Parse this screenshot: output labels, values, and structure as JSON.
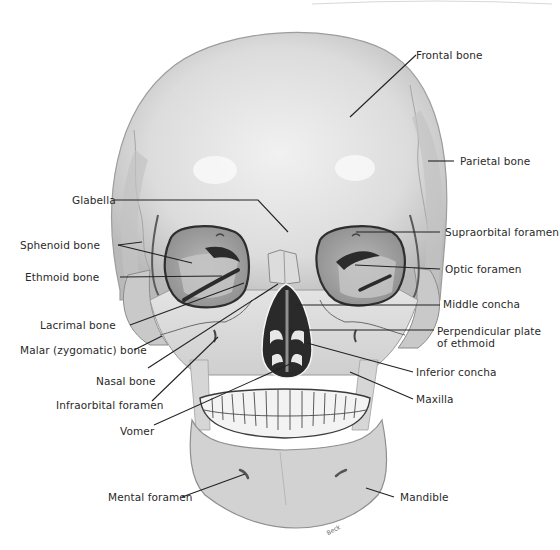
{
  "diagram": {
    "signature": "Beck",
    "colors": {
      "background": "#ffffff",
      "bone_light": "#e6e6e6",
      "bone_mid": "#cfcfcf",
      "bone_dark": "#a8a8a8",
      "orbit_fill": "#9a9a9a",
      "cavity_dark": "#2c2c2c",
      "leader_line": "#222222",
      "label_text": "#2a2a2a"
    },
    "labels_left": [
      {
        "id": "glabella",
        "text": "Glabella",
        "x": 72,
        "y": 194,
        "line": [
          [
            114,
            200
          ],
          [
            258,
            200
          ],
          [
            288,
            232
          ]
        ]
      },
      {
        "id": "sphenoid-bone",
        "text": "Sphenoid bone",
        "x": 20,
        "y": 239,
        "line": [
          [
            118,
            245
          ],
          [
            142,
            242
          ]
        ],
        "line2": [
          [
            118,
            245
          ],
          [
            192,
            263
          ]
        ]
      },
      {
        "id": "ethmoid-bone",
        "text": "Ethmoid bone",
        "x": 25,
        "y": 271,
        "line": [
          [
            120,
            277
          ],
          [
            222,
            276
          ]
        ]
      },
      {
        "id": "lacrimal-bone",
        "text": "Lacrimal bone",
        "x": 40,
        "y": 319,
        "line": [
          [
            130,
            325
          ],
          [
            244,
            283
          ]
        ]
      },
      {
        "id": "malar-zygomatic-bone",
        "text": "Malar (zygomatic) bone",
        "x": 20,
        "y": 344,
        "line": [
          [
            134,
            350
          ],
          [
            162,
            336
          ]
        ]
      },
      {
        "id": "nasal-bone",
        "text": "Nasal bone",
        "x": 96,
        "y": 375,
        "line": [
          [
            148,
            368
          ],
          [
            278,
            284
          ]
        ]
      },
      {
        "id": "infraorbital-foramen",
        "text": "Infraorbital foramen",
        "x": 56,
        "y": 399,
        "line": [
          [
            152,
            401
          ],
          [
            218,
            337
          ]
        ]
      },
      {
        "id": "vomer",
        "text": "Vomer",
        "x": 120,
        "y": 425,
        "line": [
          [
            154,
            425
          ],
          [
            290,
            364
          ]
        ]
      },
      {
        "id": "mental-foramen",
        "text": "Mental foramen",
        "x": 108,
        "y": 491,
        "line": [
          [
            182,
            497
          ],
          [
            245,
            474
          ]
        ]
      }
    ],
    "labels_right": [
      {
        "id": "frontal-bone",
        "text": "Frontal bone",
        "x": 416,
        "y": 49,
        "line": [
          [
            416,
            55
          ],
          [
            350,
            117
          ]
        ]
      },
      {
        "id": "parietal-bone",
        "text": "Parietal bone",
        "x": 460,
        "y": 155,
        "line": [
          [
            454,
            161
          ],
          [
            428,
            161
          ]
        ]
      },
      {
        "id": "supraorbital-foramen",
        "text": "Supraorbital foramen",
        "x": 445,
        "y": 226,
        "line": [
          [
            440,
            232
          ],
          [
            356,
            232
          ]
        ]
      },
      {
        "id": "optic-foramen",
        "text": "Optic foramen",
        "x": 445,
        "y": 263,
        "line": [
          [
            440,
            269
          ],
          [
            355,
            265
          ]
        ]
      },
      {
        "id": "middle-concha",
        "text": "Middle concha",
        "x": 443,
        "y": 298,
        "line": [
          [
            440,
            305
          ],
          [
            295,
            305
          ]
        ]
      },
      {
        "id": "perpendicular-plate-of-ethmoid",
        "text": "Perpendicular plate",
        "text2": "of ethmoid",
        "x": 437,
        "y": 325,
        "line": [
          [
            434,
            330
          ],
          [
            290,
            330
          ]
        ]
      },
      {
        "id": "inferior-concha",
        "text": "Inferior concha",
        "x": 416,
        "y": 366,
        "line": [
          [
            413,
            372
          ],
          [
            307,
            343
          ]
        ]
      },
      {
        "id": "maxilla",
        "text": "Maxilla",
        "x": 416,
        "y": 393,
        "line": [
          [
            413,
            399
          ],
          [
            350,
            372
          ]
        ]
      },
      {
        "id": "mandible",
        "text": "Mandible",
        "x": 400,
        "y": 491,
        "line": [
          [
            394,
            497
          ],
          [
            366,
            488
          ]
        ]
      }
    ]
  }
}
